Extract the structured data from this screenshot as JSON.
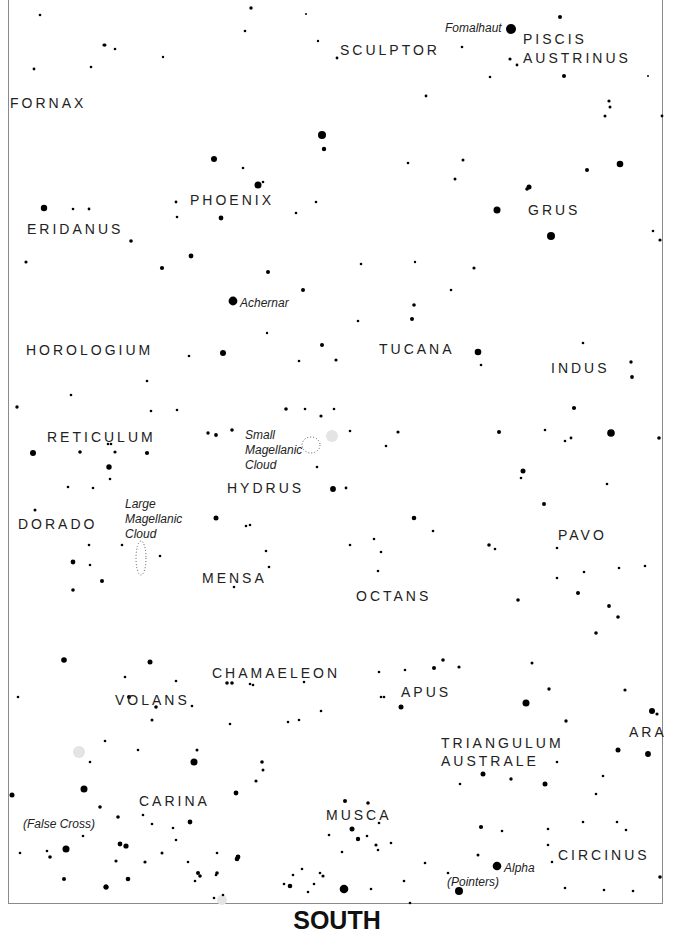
{
  "map": {
    "direction_label": "SOUTH",
    "background": "#ffffff",
    "star_color": "#000000",
    "frame_color": "#8a8a8a",
    "constellations": [
      {
        "id": "fornax",
        "name": "FORNAX",
        "x": 10,
        "y": 95
      },
      {
        "id": "sculptor",
        "name": "SCULPTOR",
        "x": 340,
        "y": 42
      },
      {
        "id": "piscis-austrinus-1",
        "name": "PISCIS",
        "x": 523,
        "y": 31
      },
      {
        "id": "piscis-austrinus-2",
        "name": "AUSTRINUS",
        "x": 523,
        "y": 50
      },
      {
        "id": "phoenix",
        "name": "PHOENIX",
        "x": 190,
        "y": 192
      },
      {
        "id": "grus",
        "name": "GRUS",
        "x": 528,
        "y": 202
      },
      {
        "id": "eridanus",
        "name": "ERIDANUS",
        "x": 27,
        "y": 221
      },
      {
        "id": "horologium",
        "name": "HOROLOGIUM",
        "x": 26,
        "y": 342
      },
      {
        "id": "tucana",
        "name": "TUCANA",
        "x": 379,
        "y": 341
      },
      {
        "id": "indus",
        "name": "INDUS",
        "x": 551,
        "y": 360
      },
      {
        "id": "reticulum",
        "name": "RETICULUM",
        "x": 47,
        "y": 429
      },
      {
        "id": "hydrus",
        "name": "HYDRUS",
        "x": 227,
        "y": 480
      },
      {
        "id": "dorado",
        "name": "DORADO",
        "x": 18,
        "y": 516
      },
      {
        "id": "pavo",
        "name": "PAVO",
        "x": 558,
        "y": 527
      },
      {
        "id": "mensa",
        "name": "MENSA",
        "x": 202,
        "y": 570
      },
      {
        "id": "octans",
        "name": "OCTANS",
        "x": 356,
        "y": 588
      },
      {
        "id": "chamaeleon",
        "name": "CHAMAELEON",
        "x": 212,
        "y": 665
      },
      {
        "id": "apus",
        "name": "APUS",
        "x": 401,
        "y": 684
      },
      {
        "id": "volans",
        "name": "VOLANS",
        "x": 115,
        "y": 692
      },
      {
        "id": "ara",
        "name": "ARA",
        "x": 629,
        "y": 724
      },
      {
        "id": "triangulum-australe-1",
        "name": "TRIANGULUM",
        "x": 441,
        "y": 735
      },
      {
        "id": "triangulum-australe-2",
        "name": "AUSTRALE",
        "x": 441,
        "y": 753
      },
      {
        "id": "carina",
        "name": "CARINA",
        "x": 139,
        "y": 793
      },
      {
        "id": "musca",
        "name": "MUSCA",
        "x": 326,
        "y": 807
      },
      {
        "id": "circinus",
        "name": "CIRCINUS",
        "x": 558,
        "y": 847
      }
    ],
    "star_names": [
      {
        "id": "fomalhaut",
        "name": "Fomalhaut",
        "x": 445,
        "y": 21
      },
      {
        "id": "achernar",
        "name": "Achernar",
        "x": 240,
        "y": 296
      },
      {
        "id": "smc-1",
        "name": "Small",
        "x": 245,
        "y": 428
      },
      {
        "id": "smc-2",
        "name": "Magellanic",
        "x": 245,
        "y": 443
      },
      {
        "id": "smc-3",
        "name": "Cloud",
        "x": 245,
        "y": 458
      },
      {
        "id": "lmc-1",
        "name": "Large",
        "x": 125,
        "y": 497
      },
      {
        "id": "lmc-2",
        "name": "Magellanic",
        "x": 125,
        "y": 512
      },
      {
        "id": "lmc-3",
        "name": "Cloud",
        "x": 125,
        "y": 527
      },
      {
        "id": "false-cross",
        "name": "(False Cross)",
        "x": 23,
        "y": 817
      },
      {
        "id": "alpha",
        "name": "Alpha",
        "x": 504,
        "y": 861
      },
      {
        "id": "pointers",
        "name": "(Pointers)",
        "x": 447,
        "y": 875
      }
    ],
    "stars": [
      [
        251,
        8,
        1.7
      ],
      [
        40,
        15,
        1.3
      ],
      [
        306,
        14,
        1
      ],
      [
        104,
        45,
        1.6
      ],
      [
        115,
        49,
        1.3
      ],
      [
        163,
        57,
        1.2
      ],
      [
        245,
        31,
        1.3
      ],
      [
        337,
        58,
        1.4
      ],
      [
        34,
        69,
        1.4
      ],
      [
        91,
        67,
        1.3
      ],
      [
        105,
        45,
        1.5
      ],
      [
        318,
        41,
        1.2
      ],
      [
        511,
        29,
        5
      ],
      [
        560,
        17,
        2
      ],
      [
        462,
        47,
        1.3
      ],
      [
        510,
        59,
        1.6
      ],
      [
        517,
        65,
        1.4
      ],
      [
        490,
        77,
        1.3
      ],
      [
        564,
        76,
        2
      ],
      [
        648,
        76,
        1
      ],
      [
        426,
        96,
        1.4
      ],
      [
        609,
        101,
        1.6
      ],
      [
        610,
        107,
        1.5
      ],
      [
        605,
        116,
        1.5
      ],
      [
        662,
        116,
        1.4
      ],
      [
        322,
        135,
        4
      ],
      [
        324,
        149,
        2.2
      ],
      [
        214,
        159,
        3
      ],
      [
        243,
        168,
        1.3
      ],
      [
        258,
        185,
        3.5
      ],
      [
        263,
        182,
        1.3
      ],
      [
        463,
        160,
        1.5
      ],
      [
        455,
        179,
        1.5
      ],
      [
        408,
        163,
        1.3
      ],
      [
        620,
        164,
        3.3
      ],
      [
        587,
        170,
        2
      ],
      [
        529,
        187,
        2.5
      ],
      [
        527,
        189,
        1.8
      ],
      [
        44,
        208,
        3.2
      ],
      [
        73,
        209,
        1.3
      ],
      [
        89,
        209,
        1.4
      ],
      [
        176,
        202,
        1.4
      ],
      [
        221,
        218,
        2.4
      ],
      [
        177,
        217,
        1.3
      ],
      [
        316,
        202,
        1.3
      ],
      [
        296,
        213,
        1.3
      ],
      [
        497,
        210,
        3.5
      ],
      [
        551,
        236,
        4
      ],
      [
        131,
        241,
        1.8
      ],
      [
        653,
        231,
        1.3
      ],
      [
        660,
        240,
        1.6
      ],
      [
        26,
        262,
        1.6
      ],
      [
        162,
        268,
        2.1
      ],
      [
        191,
        256,
        2.4
      ],
      [
        268,
        272,
        2
      ],
      [
        361,
        264,
        1.3
      ],
      [
        415,
        262,
        1.2
      ],
      [
        474,
        268,
        1.6
      ],
      [
        451,
        290,
        1.3
      ],
      [
        233,
        301,
        4.4
      ],
      [
        303,
        290,
        2
      ],
      [
        267,
        333,
        1.2
      ],
      [
        358,
        321,
        1.3
      ],
      [
        414,
        305,
        1.8
      ],
      [
        223,
        353,
        3
      ],
      [
        189,
        356,
        1.3
      ],
      [
        147,
        381,
        1.3
      ],
      [
        322,
        345,
        2
      ],
      [
        299,
        361,
        1.3
      ],
      [
        336,
        360,
        1.6
      ],
      [
        412,
        319,
        2
      ],
      [
        478,
        352,
        3.3
      ],
      [
        481,
        365,
        1.3
      ],
      [
        583,
        343,
        1.3
      ],
      [
        631,
        362,
        1.7
      ],
      [
        632,
        377,
        1.9
      ],
      [
        17,
        407,
        1.7
      ],
      [
        71,
        395,
        1.3
      ],
      [
        151,
        411,
        1.3
      ],
      [
        177,
        410,
        1.3
      ],
      [
        208,
        433,
        1.7
      ],
      [
        216,
        435,
        1.9
      ],
      [
        232,
        430,
        1.8
      ],
      [
        286,
        409,
        1.8
      ],
      [
        321,
        416,
        1.6
      ],
      [
        334,
        409,
        1.3
      ],
      [
        305,
        409,
        1.3
      ],
      [
        33,
        453,
        3
      ],
      [
        80,
        452,
        1.8
      ],
      [
        108,
        444,
        1.3
      ],
      [
        111,
        444,
        1.3
      ],
      [
        115,
        452,
        1.6
      ],
      [
        147,
        453,
        2.1
      ],
      [
        109,
        467,
        2.7
      ],
      [
        68,
        487,
        1.3
      ],
      [
        93,
        488,
        1.3
      ],
      [
        110,
        479,
        1.3
      ],
      [
        317,
        467,
        1.3
      ],
      [
        333,
        489,
        2.9
      ],
      [
        346,
        488,
        1.4
      ],
      [
        350,
        431,
        1.3
      ],
      [
        398,
        432,
        1.6
      ],
      [
        386,
        446,
        1.3
      ],
      [
        499,
        432,
        2
      ],
      [
        545,
        430,
        1.3
      ],
      [
        574,
        408,
        2.1
      ],
      [
        611,
        433,
        3.8
      ],
      [
        659,
        438,
        1.8
      ],
      [
        571,
        438,
        1.4
      ],
      [
        565,
        441,
        1.3
      ],
      [
        523,
        471,
        2.5
      ],
      [
        521,
        478,
        1.3
      ],
      [
        607,
        484,
        1.3
      ],
      [
        35,
        510,
        1.5
      ],
      [
        122,
        545,
        1.3
      ],
      [
        89,
        545,
        1.3
      ],
      [
        73,
        562,
        2.4
      ],
      [
        90,
        565,
        1.3
      ],
      [
        102,
        581,
        2
      ],
      [
        73,
        590,
        1.8
      ],
      [
        216,
        518,
        2.5
      ],
      [
        250,
        525,
        1.3
      ],
      [
        160,
        556,
        1.3
      ],
      [
        266,
        551,
        1.3
      ],
      [
        246,
        526,
        1.3
      ],
      [
        234,
        587,
        1.3
      ],
      [
        269,
        567,
        1.3
      ],
      [
        350,
        545,
        1.3
      ],
      [
        374,
        539,
        1.3
      ],
      [
        381,
        552,
        1.3
      ],
      [
        414,
        518,
        2.3
      ],
      [
        433,
        531,
        1.3
      ],
      [
        378,
        571,
        1.3
      ],
      [
        489,
        545,
        1.8
      ],
      [
        495,
        549,
        1.3
      ],
      [
        544,
        504,
        2
      ],
      [
        557,
        548,
        1.3
      ],
      [
        557,
        578,
        1.3
      ],
      [
        578,
        593,
        2
      ],
      [
        584,
        572,
        1.3
      ],
      [
        619,
        568,
        1.3
      ],
      [
        645,
        566,
        1.3
      ],
      [
        609,
        606,
        1.9
      ],
      [
        618,
        617,
        1.8
      ],
      [
        596,
        633,
        1.8
      ],
      [
        518,
        600,
        1.8
      ],
      [
        443,
        660,
        1.8
      ],
      [
        459,
        667,
        1.6
      ],
      [
        434,
        668,
        2
      ],
      [
        405,
        670,
        1.3
      ],
      [
        379,
        672,
        1.3
      ],
      [
        381,
        697,
        1.3
      ],
      [
        384,
        697,
        1.3
      ],
      [
        401,
        707,
        2.5
      ],
      [
        526,
        703,
        3.5
      ],
      [
        532,
        663,
        1.5
      ],
      [
        549,
        689,
        1.7
      ],
      [
        625,
        690,
        1.6
      ],
      [
        652,
        711,
        3
      ],
      [
        657,
        714,
        1.6
      ],
      [
        618,
        750,
        2.5
      ],
      [
        648,
        754,
        2.9
      ],
      [
        64,
        660,
        2.8
      ],
      [
        150,
        662,
        2.5
      ],
      [
        125,
        677,
        1.3
      ],
      [
        176,
        681,
        1.3
      ],
      [
        129,
        697,
        2
      ],
      [
        156,
        707,
        1.8
      ],
      [
        192,
        706,
        1.3
      ],
      [
        227,
        683,
        1.8
      ],
      [
        232,
        683,
        1.8
      ],
      [
        250,
        684,
        1.3
      ],
      [
        253,
        685,
        1.3
      ],
      [
        304,
        682,
        1.3
      ],
      [
        321,
        711,
        1.3
      ],
      [
        299,
        720,
        1.3
      ],
      [
        18,
        697,
        1.3
      ],
      [
        152,
        720,
        1.5
      ],
      [
        138,
        750,
        1.3
      ],
      [
        194,
        762,
        3.5
      ],
      [
        197,
        750,
        1.5
      ],
      [
        230,
        724,
        1.3
      ],
      [
        262,
        762,
        1.8
      ],
      [
        263,
        770,
        1.5
      ],
      [
        256,
        781,
        1.6
      ],
      [
        288,
        722,
        1.3
      ],
      [
        105,
        741,
        1.3
      ],
      [
        90,
        762,
        1.3
      ],
      [
        84,
        789,
        3.5
      ],
      [
        12,
        795,
        2.5
      ],
      [
        100,
        807,
        1.8
      ],
      [
        118,
        817,
        1.8
      ],
      [
        143,
        815,
        1.3
      ],
      [
        152,
        824,
        1.3
      ],
      [
        190,
        822,
        2.4
      ],
      [
        236,
        793,
        2.4
      ],
      [
        173,
        828,
        1.3
      ],
      [
        83,
        836,
        1.3
      ],
      [
        66,
        849,
        3.5
      ],
      [
        126,
        846,
        2.6
      ],
      [
        120,
        844,
        2.4
      ],
      [
        116,
        861,
        1.6
      ],
      [
        145,
        862,
        1.6
      ],
      [
        162,
        853,
        1.5
      ],
      [
        176,
        840,
        1.3
      ],
      [
        188,
        862,
        1.3
      ],
      [
        216,
        875,
        1.3
      ],
      [
        198,
        873,
        2
      ],
      [
        217,
        853,
        1.3
      ],
      [
        238,
        857,
        2.4
      ],
      [
        237,
        859,
        2.3
      ],
      [
        106,
        887,
        2.5
      ],
      [
        128,
        879,
        2.3
      ],
      [
        64,
        879,
        2
      ],
      [
        50,
        857,
        1.8
      ],
      [
        47,
        851,
        1.3
      ],
      [
        20,
        853,
        1.3
      ],
      [
        106,
        887,
        2.5
      ],
      [
        200,
        876,
        1.8
      ],
      [
        217,
        873,
        1.8
      ],
      [
        345,
        801,
        2
      ],
      [
        368,
        803,
        1.8
      ],
      [
        352,
        829,
        2.5
      ],
      [
        358,
        839,
        2.2
      ],
      [
        329,
        835,
        1.3
      ],
      [
        302,
        869,
        1.3
      ],
      [
        293,
        875,
        1.3
      ],
      [
        320,
        873,
        1.3
      ],
      [
        290,
        886,
        2.3
      ],
      [
        344,
        889,
        4.3
      ],
      [
        371,
        889,
        1.3
      ],
      [
        308,
        892,
        1.3
      ],
      [
        284,
        884,
        1.3
      ],
      [
        314,
        884,
        1.3
      ],
      [
        323,
        876,
        1.6
      ],
      [
        376,
        845,
        1.6
      ],
      [
        378,
        850,
        1.3
      ],
      [
        367,
        836,
        1.3
      ],
      [
        342,
        852,
        1.3
      ],
      [
        483,
        774,
        2.5
      ],
      [
        511,
        779,
        1.7
      ],
      [
        545,
        784,
        2.5
      ],
      [
        557,
        762,
        1.3
      ],
      [
        566,
        721,
        1.7
      ],
      [
        583,
        822,
        1.3
      ],
      [
        481,
        827,
        2.1
      ],
      [
        497,
        866,
        4.3
      ],
      [
        459,
        891,
        4
      ],
      [
        448,
        873,
        1.3
      ],
      [
        460,
        784,
        1.3
      ],
      [
        478,
        855,
        1.5
      ],
      [
        425,
        863,
        1.3
      ],
      [
        404,
        881,
        1.3
      ],
      [
        379,
        823,
        1.3
      ],
      [
        391,
        843,
        1.3
      ],
      [
        617,
        822,
        1.3
      ],
      [
        626,
        830,
        1.3
      ],
      [
        548,
        845,
        1.3
      ],
      [
        552,
        862,
        1.3
      ],
      [
        502,
        831,
        1.3
      ],
      [
        548,
        829,
        1.3
      ],
      [
        603,
        776,
        1.3
      ],
      [
        596,
        794,
        1.3
      ],
      [
        660,
        877,
        1.8
      ],
      [
        565,
        888,
        1.3
      ],
      [
        604,
        890,
        1.3
      ],
      [
        633,
        891,
        1.3
      ],
      [
        410,
        903,
        1.3
      ],
      [
        223,
        895,
        1.3
      ],
      [
        195,
        881,
        1.3
      ],
      [
        214,
        898,
        1.3
      ]
    ],
    "clouds": [
      {
        "id": "smc",
        "cx": 311,
        "cy": 445,
        "rx": 9,
        "ry": 8
      },
      {
        "id": "lmc",
        "cx": 141,
        "cy": 558,
        "rx": 5,
        "ry": 17
      }
    ],
    "nebula_glows": [
      {
        "cx": 332,
        "cy": 436,
        "r": 6
      },
      {
        "cx": 79,
        "cy": 752,
        "r": 6
      },
      {
        "cx": 222,
        "cy": 900,
        "r": 5
      }
    ]
  }
}
